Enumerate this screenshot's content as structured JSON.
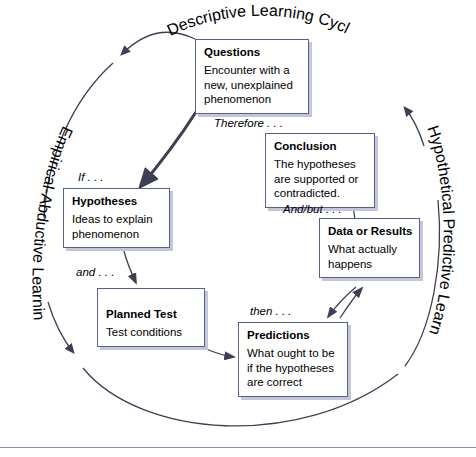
{
  "diagram": {
    "colors": {
      "box_border": "#5a5f8f",
      "box_shadow": "#c3c5dc",
      "box_fill": "#ffffff",
      "arrow": "#3e3e54",
      "background": "#ffffff",
      "rule": "#8d90ad"
    },
    "cycle_labels": {
      "top": "Descriptive Learning Cycles",
      "left": "Empirical-Abductive Learning Cycles",
      "right": "Hypothetical Predictive Learning Cycles"
    },
    "nodes": [
      {
        "id": "questions",
        "title": "Questions",
        "body": "Encounter with a new, unexplained phenomenon"
      },
      {
        "id": "conclusion",
        "title": "Conclusion",
        "body": "The hypotheses are supported or contradicted."
      },
      {
        "id": "hypotheses",
        "title": "Hypotheses",
        "body": "Ideas to explain phenomenon"
      },
      {
        "id": "data-or-results",
        "title": "Data or Results",
        "body": "What actually happens"
      },
      {
        "id": "planned-test",
        "title": "Planned Test",
        "body": "Test conditions"
      },
      {
        "id": "predictions",
        "title": "Predictions",
        "body": "What ought to be if the hypotheses are correct"
      }
    ],
    "connector_labels": {
      "therefore": "Therefore . . .",
      "and_but": "And/but . . .",
      "if": "If . . .",
      "and": "and . . .",
      "then": "then . . ."
    }
  }
}
